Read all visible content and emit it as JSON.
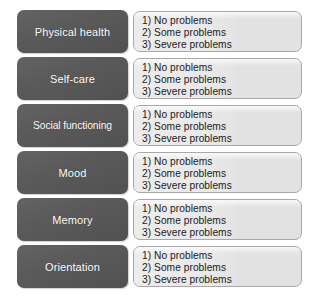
{
  "diagram": {
    "colors": {
      "domain_box": "#5a5a5a",
      "domain_label_text": "#ffffff",
      "options_panel": "#e2e2e2",
      "options_panel_border": "#a8a8a8",
      "options_text": "#1b1b1b",
      "background": "#ffffff"
    },
    "shared_options": [
      "1) No problems",
      "2) Some problems",
      "3) Severe problems"
    ],
    "rows": [
      {
        "domain": "Physical health",
        "options": [
          "1) No problems",
          "2) Some problems",
          "3) Severe problems"
        ]
      },
      {
        "domain": "Self-care",
        "options": [
          "1) No problems",
          "2) Some problems",
          "3) Severe problems"
        ]
      },
      {
        "domain": "Social functioning",
        "options": [
          "1) No problems",
          "2) Some problems",
          "3) Severe problems"
        ]
      },
      {
        "domain": "Mood",
        "options": [
          "1) No problems",
          "2) Some problems",
          "3) Severe problems"
        ]
      },
      {
        "domain": "Memory",
        "options": [
          "1) No problems",
          "2) Some problems",
          "3) Severe problems"
        ]
      },
      {
        "domain": "Orientation",
        "options": [
          "1) No problems",
          "2) Some problems",
          "3) Severe problems"
        ]
      }
    ]
  }
}
